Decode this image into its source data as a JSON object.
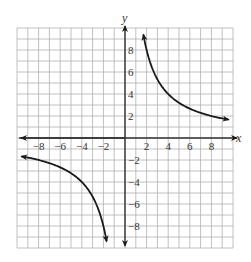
{
  "chart_data": {
    "type": "line",
    "title": "",
    "xlabel": "x",
    "ylabel": "y",
    "xlim": [
      -10,
      10
    ],
    "ylim": [
      -10,
      10
    ],
    "grid": true,
    "grid_step": 1,
    "x_ticks": [
      -8,
      -6,
      -4,
      -2,
      2,
      4,
      6,
      8
    ],
    "y_ticks": [
      8,
      6,
      4,
      2,
      -2,
      -4,
      -6,
      -8
    ],
    "x_tick_labels": [
      "−8",
      "−6",
      "−4",
      "−2",
      "2",
      "4",
      "6",
      "8"
    ],
    "y_tick_labels": [
      "8",
      "6",
      "4",
      "2",
      "−2",
      "−4",
      "−6",
      "−8"
    ],
    "function": "y = 16/x",
    "series": [
      {
        "name": "branch-positive",
        "x": [
          1.7,
          2,
          2.5,
          3,
          4,
          5,
          6,
          7,
          8,
          9,
          9.6
        ],
        "y": [
          9.41,
          8,
          6.4,
          5.33,
          4,
          3.2,
          2.67,
          2.29,
          2,
          1.78,
          1.67
        ],
        "arrows": "both"
      },
      {
        "name": "branch-negative",
        "x": [
          -9.6,
          -9,
          -8,
          -7,
          -6,
          -5,
          -4,
          -3,
          -2.5,
          -2,
          -1.7
        ],
        "y": [
          -1.67,
          -1.78,
          -2,
          -2.29,
          -2.67,
          -3.2,
          -4,
          -5.33,
          -6.4,
          -8,
          -9.41
        ],
        "arrows": "both"
      }
    ],
    "colors": {
      "grid": "#b0b0b0",
      "axis": "#333333",
      "curve": "#1a1a1a"
    }
  }
}
